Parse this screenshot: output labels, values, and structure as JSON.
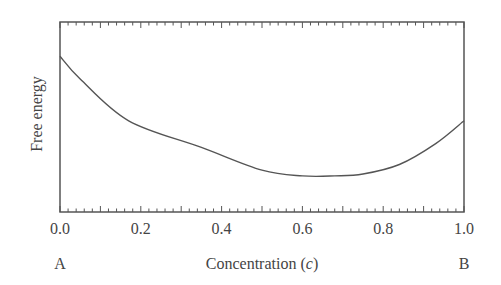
{
  "chart_data": {
    "type": "line",
    "title": "",
    "xlabel": "Concentration (c)",
    "xlabel_prefix": "Concentration (",
    "xlabel_var": "c",
    "xlabel_suffix": ")",
    "ylabel": "Free energy",
    "xlim": [
      0.0,
      1.0
    ],
    "ylim": [
      0,
      1
    ],
    "x_ticks": [
      "0.0",
      "0.2",
      "0.4",
      "0.6",
      "0.8",
      "1.0"
    ],
    "y_ticks": [],
    "end_labels": {
      "left": "A",
      "right": "B"
    },
    "grid": false,
    "legend": null,
    "series": [
      {
        "name": "Free energy curve",
        "x": [
          0.0,
          0.05,
          0.17,
          0.35,
          0.5,
          0.6,
          0.68,
          0.75,
          0.84,
          0.93,
          1.0
        ],
        "y": [
          0.82,
          0.7,
          0.48,
          0.34,
          0.22,
          0.19,
          0.19,
          0.2,
          0.25,
          0.36,
          0.48
        ]
      }
    ],
    "minimum_at_c": 0.67
  }
}
